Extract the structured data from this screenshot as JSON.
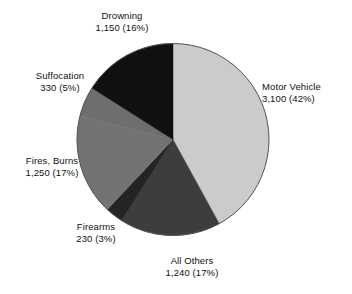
{
  "chart_data": {
    "type": "pie",
    "title": "",
    "subtitle": "",
    "xlabel": "",
    "ylabel": "",
    "legend_position": "none",
    "grid": false,
    "total": 7300,
    "categories": [
      "Motor Vehicle",
      "All Others",
      "Firearms",
      "Fires, Burns",
      "Suffocation",
      "Drowning"
    ],
    "values": [
      3100,
      1240,
      230,
      1250,
      330,
      1150
    ],
    "percents": [
      42,
      17,
      3,
      17,
      5,
      16
    ],
    "colors": [
      "#cbcbcb",
      "#3d3d3d",
      "#242424",
      "#737373",
      "#6e6e6e",
      "#101010"
    ],
    "slices": [
      {
        "name": "Motor Vehicle",
        "value": 3100,
        "value_text": "3,100",
        "percent": 42,
        "percent_text": "(42%)",
        "label_line1": "Motor Vehicle",
        "label_line2": "3,100 (42%)",
        "color": "#cbcbcb",
        "start_angle": 0,
        "end_angle": 151.2
      },
      {
        "name": "All Others",
        "value": 1240,
        "value_text": "1,240",
        "percent": 17,
        "percent_text": "(17%)",
        "label_line1": "All Others",
        "label_line2": "1,240 (17%)",
        "color": "#3d3d3d",
        "start_angle": 151.2,
        "end_angle": 212.4
      },
      {
        "name": "Firearms",
        "value": 230,
        "value_text": "230",
        "percent": 3,
        "percent_text": "(3%)",
        "label_line1": "Firearms",
        "label_line2": "230 (3%)",
        "color": "#242424",
        "start_angle": 212.4,
        "end_angle": 223.2
      },
      {
        "name": "Fires, Burns",
        "value": 1250,
        "value_text": "1,250",
        "percent": 17,
        "percent_text": "(17%)",
        "label_line1": "Fires, Burns",
        "label_line2": "1,250 (17%)",
        "color": "#737373",
        "start_angle": 223.2,
        "end_angle": 284.4
      },
      {
        "name": "Suffocation",
        "value": 330,
        "value_text": "330",
        "percent": 5,
        "percent_text": "(5%)",
        "label_line1": "Suffocation",
        "label_line2": "330 (5%)",
        "color": "#6e6e6e",
        "start_angle": 284.4,
        "end_angle": 302.4
      },
      {
        "name": "Drowning",
        "value": 1150,
        "value_text": "1,150",
        "percent": 16,
        "percent_text": "(16%)",
        "label_line1": "Drowning",
        "label_line2": "1,150 (16%)",
        "color": "#101010",
        "start_angle": 302.4,
        "end_angle": 360
      }
    ]
  },
  "figure": {
    "background": "#ffffff",
    "outline_color": "#555555",
    "text_color": "#111111"
  }
}
